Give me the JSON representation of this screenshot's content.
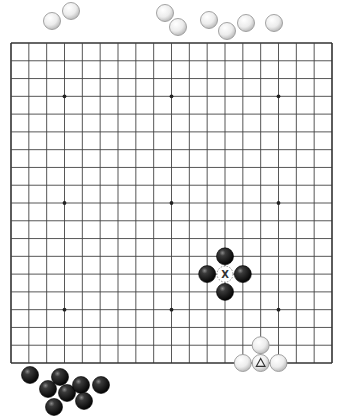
{
  "board": {
    "size": 19,
    "left": 11,
    "top": 43,
    "right": 332,
    "bottom": 363,
    "line_color": "#444444",
    "border_color": "#333333",
    "star_points": [
      [
        3,
        3
      ],
      [
        9,
        3
      ],
      [
        15,
        3
      ],
      [
        3,
        9
      ],
      [
        9,
        9
      ],
      [
        15,
        9
      ],
      [
        3,
        15
      ],
      [
        9,
        15
      ],
      [
        15,
        15
      ]
    ]
  },
  "stone_radius": 8.5,
  "colors": {
    "black_stone": "#111111",
    "white_stone": "#f2f2f2",
    "white_stone_edge": "#9a9a9a"
  },
  "board_stones": {
    "black": [
      {
        "col": 12,
        "row": 12
      },
      {
        "col": 11,
        "row": 13
      },
      {
        "col": 13,
        "row": 13
      },
      {
        "col": 12,
        "row": 14
      }
    ],
    "white": [
      {
        "col": 14,
        "row": 17
      },
      {
        "col": 13,
        "row": 18
      },
      {
        "col": 14,
        "row": 18,
        "marker": "triangle"
      },
      {
        "col": 15,
        "row": 18
      }
    ]
  },
  "markers": [
    {
      "type": "x-point",
      "col": 12,
      "row": 13,
      "label": "X"
    }
  ],
  "triangle_label": "Δ",
  "captured": {
    "white_top": [
      {
        "x": 52,
        "y": 21
      },
      {
        "x": 71,
        "y": 11
      },
      {
        "x": 165,
        "y": 13
      },
      {
        "x": 178,
        "y": 27
      },
      {
        "x": 209,
        "y": 20
      },
      {
        "x": 227,
        "y": 31
      },
      {
        "x": 246,
        "y": 23
      },
      {
        "x": 274,
        "y": 23
      }
    ],
    "black_bottom": [
      {
        "x": 30,
        "y": 375
      },
      {
        "x": 60,
        "y": 377
      },
      {
        "x": 48,
        "y": 389
      },
      {
        "x": 67,
        "y": 393
      },
      {
        "x": 81,
        "y": 385
      },
      {
        "x": 101,
        "y": 385
      },
      {
        "x": 84,
        "y": 401
      },
      {
        "x": 54,
        "y": 407
      }
    ]
  }
}
